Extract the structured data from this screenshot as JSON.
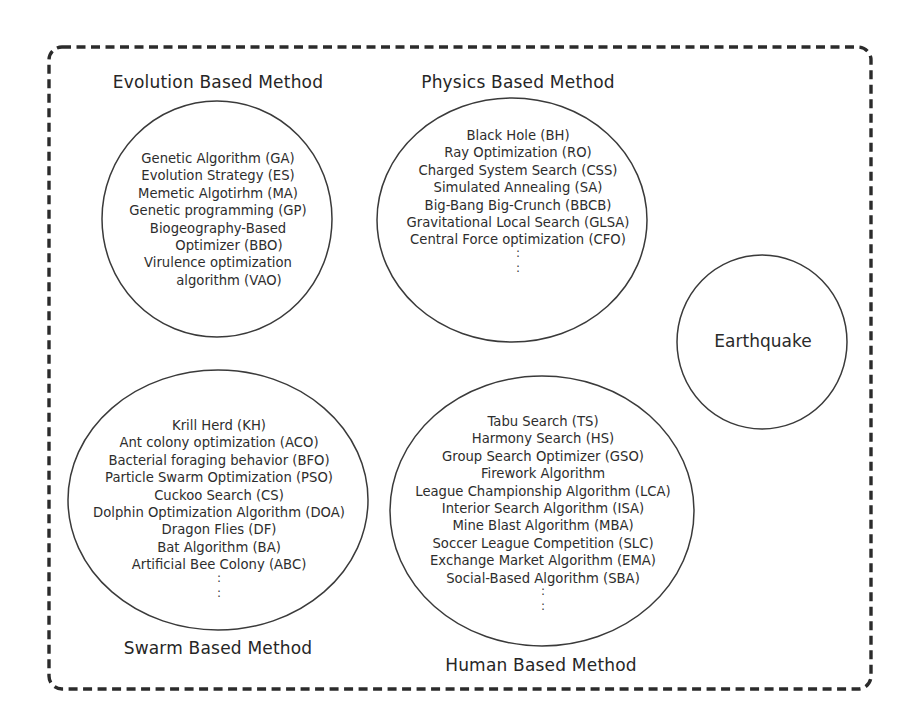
{
  "diagram": {
    "colors": {
      "stroke": "#3a3a3a",
      "frame": "#2b2b2b",
      "text": "#2a2a2a",
      "background": "#ffffff"
    },
    "groups": {
      "evolution": {
        "title": "Evolution Based Method",
        "items": [
          "Genetic Algorithm (GA)",
          "Evolution Strategy (ES)",
          "Memetic Algotirhm (MA)",
          "Genetic programming (GP)",
          "Biogeography-Based",
          "Optimizer (BBO)",
          "Virulence optimization",
          "algorithm (VAO)"
        ],
        "has_ellipsis": false
      },
      "physics": {
        "title": "Physics Based Method",
        "items": [
          "Black Hole (BH)",
          "Ray Optimization (RO)",
          "Charged System Search (CSS)",
          "Simulated Annealing (SA)",
          "Big-Bang Big-Crunch (BBCB)",
          "Gravitational Local Search (GLSA)",
          "Central Force optimization (CFO)"
        ],
        "has_ellipsis": true,
        "ellipsis": ":"
      },
      "swarm": {
        "title": "Swarm Based Method",
        "items": [
          "Krill Herd (KH)",
          "Ant colony optimization (ACO)",
          "Bacterial foraging behavior (BFO)",
          "Particle Swarm Optimization (PSO)",
          "Cuckoo Search (CS)",
          "Dolphin Optimization Algorithm (DOA)",
          "Dragon Flies (DF)",
          "Bat Algorithm (BA)",
          "Artificial Bee Colony (ABC)"
        ],
        "has_ellipsis": true,
        "ellipsis": ":"
      },
      "human": {
        "title": "Human Based Method",
        "items": [
          "Tabu Search (TS)",
          "Harmony Search (HS)",
          "Group Search Optimizer (GSO)",
          "Firework Algorithm",
          "League Championship Algorithm (LCA)",
          "Interior Search Algorithm (ISA)",
          "Mine Blast Algorithm (MBA)",
          "Soccer League Competition (SLC)",
          "Exchange Market Algorithm (EMA)",
          "Social-Based Algorithm (SBA)"
        ],
        "has_ellipsis": true,
        "ellipsis": ":"
      },
      "earthquake": {
        "label": "Earthquake"
      }
    }
  }
}
